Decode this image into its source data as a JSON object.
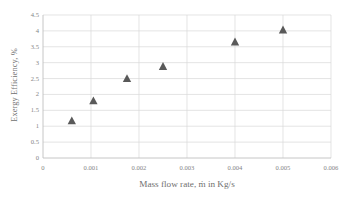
{
  "chart_data": {
    "type": "scatter",
    "title": "",
    "xlabel": "Mass flow rate, ṁ in Kg/s",
    "ylabel": "Exergy Efficiency, %",
    "x": [
      0.0006,
      0.00105,
      0.00175,
      0.0025,
      0.004,
      0.005
    ],
    "values": [
      1.17,
      1.8,
      2.5,
      2.88,
      3.65,
      4.03
    ],
    "series": [
      {
        "name": "Exergy Efficiency",
        "x": [
          0.0006,
          0.00105,
          0.00175,
          0.0025,
          0.004,
          0.005
        ],
        "values": [
          1.17,
          1.8,
          2.5,
          2.88,
          3.65,
          4.03
        ]
      }
    ],
    "xlim": [
      0,
      0.006
    ],
    "ylim": [
      0,
      4.5
    ],
    "xticks": [
      0,
      0.001,
      0.002,
      0.003,
      0.004,
      0.005,
      0.006
    ],
    "xtick_labels": [
      "0",
      "0.001",
      "0.002",
      "0.003",
      "0.004",
      "0.005",
      "0.006"
    ],
    "yticks": [
      0,
      0.5,
      1,
      1.5,
      2,
      2.5,
      3,
      3.5,
      4,
      4.5
    ],
    "ytick_labels": [
      "0",
      "0.5",
      "1",
      "1.5",
      "2",
      "2.5",
      "3",
      "3.5",
      "4",
      "4.5"
    ],
    "grid": true,
    "grid_x": true,
    "grid_y": true,
    "legend": false,
    "legend_position": "none",
    "marker": "triangle",
    "marker_color": "#595959",
    "grid_color": "#d9d9d9",
    "axis_color": "#bfbfbf",
    "text_color": "#7b7b7b"
  }
}
